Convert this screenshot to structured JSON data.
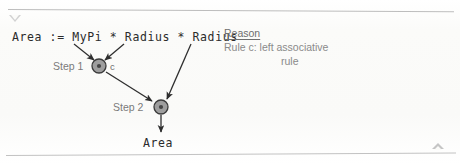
{
  "canvas": {
    "width": 460,
    "height": 164,
    "background": "#fbfbf9"
  },
  "markers": {
    "collapse_triangle": "triangle-down-icon",
    "scroll_triangle": "triangle-up-icon"
  },
  "expression": {
    "text": "Area := MyPi * Radius * Radius",
    "operands": [
      "Area",
      "MyPi",
      "Radius",
      "Radius"
    ],
    "assign_operator": ":=",
    "operators": [
      "*",
      "*"
    ]
  },
  "graph": {
    "nodes": [
      {
        "id": "step1",
        "step_label": "Step 1",
        "operator": "*",
        "result_label": "c",
        "cx": 99,
        "cy": 66,
        "r": 7,
        "fill": "#9e9e9e",
        "stroke": "#3a3a3a"
      },
      {
        "id": "step2",
        "step_label": "Step 2",
        "operator": "*",
        "result_label": "Area",
        "cx": 161,
        "cy": 107,
        "r": 7,
        "fill": "#9e9e9e",
        "stroke": "#3a3a3a"
      }
    ],
    "edges": [
      {
        "id": "mypi-to-step1",
        "from": "MyPi",
        "to": "step1",
        "x1": 74,
        "y1": 44,
        "x2": 94,
        "y2": 60
      },
      {
        "id": "radius1-to-step1",
        "from": "Radius",
        "to": "step1",
        "x1": 124,
        "y1": 44,
        "x2": 105,
        "y2": 60
      },
      {
        "id": "step1-to-step2",
        "from": "step1",
        "to": "step2",
        "x1": 106,
        "y1": 72,
        "x2": 153,
        "y2": 102
      },
      {
        "id": "radius2-to-step2",
        "from": "Radius",
        "to": "step2",
        "x1": 190,
        "y1": 44,
        "x2": 166,
        "y2": 99
      },
      {
        "id": "step2-to-area",
        "from": "step2",
        "to": "Area",
        "x1": 161,
        "y1": 115,
        "x2": 161,
        "y2": 133
      }
    ],
    "result_label": "Area",
    "edge_color": "#2e2e2e"
  },
  "reason": {
    "heading": "Reason",
    "line1": "Rule c: left associative",
    "line2": "rule"
  }
}
